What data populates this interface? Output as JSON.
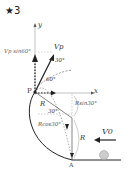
{
  "title": "★3",
  "labels": {
    "y_axis": "y",
    "x_axis": "x",
    "vp_vertical": "Vp sin60°",
    "vp": "Vp",
    "angle_30_top": "30°",
    "angle_60": "60°",
    "point_p": "P",
    "radius_r1": "R",
    "angle_30_mid": "30°",
    "r_sin30": "Rsin30°",
    "r_cos30": "Rcos30°",
    "radius_r2": "R",
    "v0": "V0",
    "point_a": "A"
  },
  "colors": {
    "line": "#222222",
    "guide": "#999999",
    "ball": "#cccccc"
  }
}
